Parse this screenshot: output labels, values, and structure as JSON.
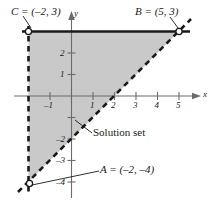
{
  "figure": {
    "type": "coordinate-plane-inequality-graph",
    "axis_labels": {
      "x": "x",
      "y": "y"
    },
    "x_ticks": [
      {
        "value": -1,
        "label": "–1"
      },
      {
        "value": 1,
        "label": "1"
      },
      {
        "value": 2,
        "label": "2"
      },
      {
        "value": 3,
        "label": "3"
      },
      {
        "value": 4,
        "label": "4"
      },
      {
        "value": 5,
        "label": "5"
      }
    ],
    "y_ticks": [
      {
        "value": 2,
        "label": "2"
      },
      {
        "value": 1,
        "label": "1"
      },
      {
        "value": -2,
        "label": "–2"
      },
      {
        "value": -3,
        "label": "–3"
      },
      {
        "value": -4,
        "label": "–4"
      }
    ],
    "points": [
      {
        "name": "C",
        "label": "C = (–2, 3)",
        "x": -2,
        "y": 3,
        "marker": "open-circle"
      },
      {
        "name": "B",
        "label": "B = (5, 3)",
        "x": 5,
        "y": 3,
        "marker": "open-circle"
      },
      {
        "name": "A",
        "label": "A = (–2, –4)",
        "x": -2,
        "y": -4,
        "marker": "open-circle"
      }
    ],
    "boundaries": [
      {
        "name": "horizontal-boundary",
        "equation": "y = 3",
        "style": "solid",
        "from": [
          -2,
          3
        ],
        "to": [
          5,
          3
        ]
      },
      {
        "name": "vertical-boundary",
        "equation": "x = –2",
        "style": "dashed",
        "from": [
          -2,
          3
        ],
        "to": [
          -2,
          -4
        ]
      },
      {
        "name": "diagonal-boundary",
        "equation": "y = x – 2",
        "style": "dashed",
        "from": [
          -2,
          -4
        ],
        "to": [
          5,
          3
        ]
      }
    ],
    "region": {
      "name": "solution-set",
      "annotation": "Solution set",
      "vertices": [
        [
          -2,
          3
        ],
        [
          5,
          3
        ],
        [
          -2,
          -4
        ]
      ],
      "fill_color": "#c9c9c9"
    },
    "colors": {
      "axis": "#6b6b6b",
      "boundary": "#1a1a1a",
      "fill": "#c9c9c9",
      "text": "#1a1a1a"
    },
    "axis_ranges": {
      "xlim": [
        -2.6,
        6.2
      ],
      "ylim": [
        -4.8,
        4.2
      ]
    },
    "grid": false
  }
}
